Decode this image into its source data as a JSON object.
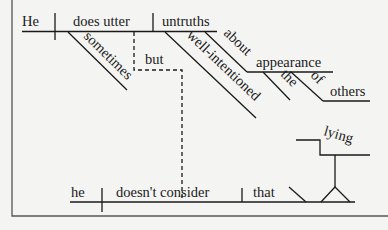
{
  "diagram": {
    "type": "sentence-diagram",
    "main_clause": {
      "subject": "He",
      "verb": "does utter",
      "object": "untruths",
      "modifiers": {
        "verb_adverb": "sometimes",
        "object_adjective": "well-intentioned",
        "object_prep": "about",
        "prep_object": "appearance",
        "prep_object_article": "the",
        "nested_prep": "of",
        "nested_prep_object": "others"
      }
    },
    "conjunction": "but",
    "second_clause": {
      "subject": "he",
      "verb": "doesn't consider",
      "object": "that",
      "object_complement": "lying"
    },
    "colors": {
      "line": "#1a1a1a",
      "background": "#f4f4f2",
      "frame": "#555555"
    }
  }
}
